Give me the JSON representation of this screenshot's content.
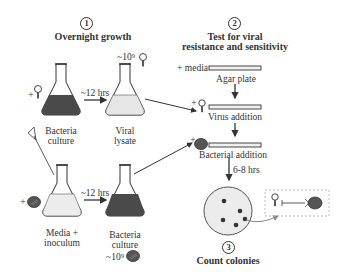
{
  "step1": {
    "number": "1",
    "title": "Overnight growth",
    "top_row": {
      "left_flask": {
        "label_line1": "Bacteria",
        "label_line2": "culture",
        "added": "+"
      },
      "arrow_label": "~12 hrs",
      "right_flask": {
        "label_line1": "Viral",
        "label_line2": "lysate",
        "count": "~10⁹"
      }
    },
    "bottom_row": {
      "left_flask": {
        "label_line1": "Media +",
        "label_line2": "inoculum",
        "added": "+"
      },
      "arrow_label": "~12 hrs",
      "right_flask": {
        "label_line1": "Bacteria",
        "label_line2": "culture",
        "count": "~10⁹"
      }
    }
  },
  "step2": {
    "number": "2",
    "title_line1": "Test for viral",
    "title_line2": "resistance and sensitivity",
    "media_label": "+ media",
    "plate1_label": "Agar plate",
    "plate2_label": "Virus addition",
    "plate2_added": "+",
    "plate3_label": "Bacterial addition",
    "plate3_added": "+",
    "incubation_label": "6-8 hrs"
  },
  "step3": {
    "number": "3",
    "title": "Count colonies"
  },
  "colors": {
    "dark_culture": "#4a4a4a",
    "light_lysate": "#e6e6e6",
    "plate_fill": "#f0f0f0",
    "stroke": "#333333",
    "inset_border": "#aaaaaa"
  }
}
